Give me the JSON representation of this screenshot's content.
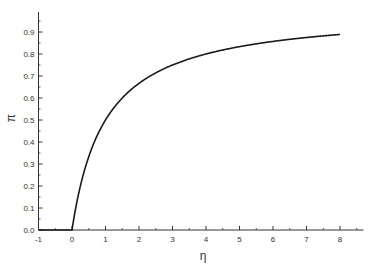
{
  "chart_data": {
    "type": "line",
    "title": "",
    "xlabel": "η",
    "ylabel": "π",
    "xlim": [
      -1,
      8.7
    ],
    "ylim": [
      0.0,
      1.0
    ],
    "x_ticks": [
      "-1",
      "0",
      "1",
      "2",
      "3",
      "4",
      "5",
      "6",
      "7",
      "8"
    ],
    "y_ticks": [
      "0.0",
      "0.1",
      "0.2",
      "0.3",
      "0.4",
      "0.5",
      "0.6",
      "0.7",
      "0.8",
      "0.9"
    ],
    "grid": false,
    "legend": null,
    "series": [
      {
        "name": "π(η)",
        "color": "#1a1a1a",
        "x": [
          -1,
          0,
          0.25,
          0.5,
          0.75,
          1,
          1.5,
          2,
          2.5,
          3,
          3.5,
          4,
          5,
          6,
          7,
          8
        ],
        "y": [
          0.0,
          0.0,
          0.2,
          0.333,
          0.429,
          0.5,
          0.6,
          0.667,
          0.714,
          0.75,
          0.778,
          0.8,
          0.833,
          0.857,
          0.875,
          0.889
        ]
      }
    ]
  },
  "axes": {
    "x_label": "η",
    "y_label": "π"
  }
}
